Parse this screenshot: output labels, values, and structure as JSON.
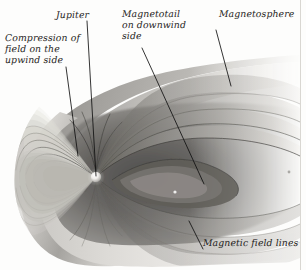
{
  "figure": {
    "width": 306,
    "height": 270,
    "background_color": "#fdfdfc",
    "label_color": "#1d1c1a",
    "leader_line_color": "#111111"
  },
  "labels": {
    "jupiter": "Jupiter",
    "magnetotail": "Magnetotail\non downwind\nside",
    "magnetosphere": "Magnetosphere",
    "compression": "Compression of\nfield on the\nupwind side",
    "field_lines": "Magnetic field lines"
  },
  "leader_lines": [
    {
      "name": "jupiter-leader",
      "x1": 87,
      "y1": 21,
      "x2": 96,
      "y2": 176
    },
    {
      "name": "compression-leader",
      "x1": 66,
      "y1": 67,
      "x2": 78,
      "y2": 156
    },
    {
      "name": "magnetotail-leader",
      "x1": 142,
      "y1": 48,
      "x2": 204,
      "y2": 184
    },
    {
      "name": "magnetosphere-leader",
      "x1": 216,
      "y1": 30,
      "x2": 231,
      "y2": 86
    },
    {
      "name": "field-lines-leader",
      "x1": 189,
      "y1": 221,
      "x2": 203,
      "y2": 249
    }
  ],
  "diagram": {
    "planet": {
      "name": "Jupiter",
      "cx": 96,
      "cy": 177,
      "r": 5.2,
      "color": "#f2f0ec"
    },
    "magnetosphere_envelope": {
      "description": "Bow-shock shaped cavity, rounded on the upwind (left) side, flaring into a long tail downwind (right)",
      "nose_x": 14,
      "tail_x": 295,
      "top_y": 62,
      "bottom_y": 262
    },
    "field_loops": {
      "upwind_count": 11,
      "downwind_count": 9,
      "description": "Nested dipole field lines compressed on the upwind side and stretched into the magnetotail downwind"
    },
    "palette": {
      "envelope_light": "#e8e6e2",
      "envelope_mid": "#b7b5b1",
      "envelope_dark": "#6e6c69",
      "shadow": "#3a3937",
      "highlight": "#fbfaf8"
    }
  }
}
